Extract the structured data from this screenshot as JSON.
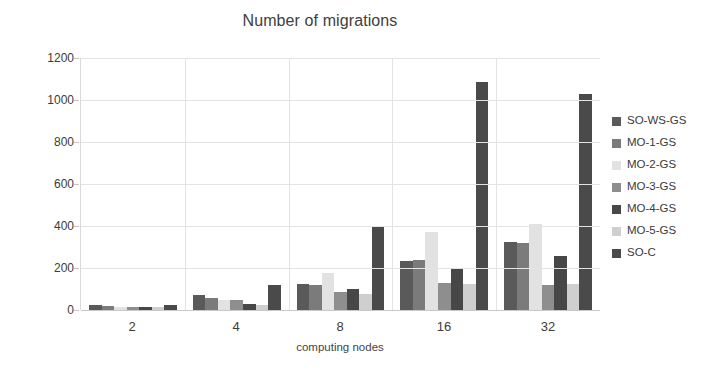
{
  "chart_data": {
    "type": "bar",
    "title": "Number of migrations",
    "xlabel": "computing nodes",
    "ylabel": "",
    "categories": [
      "2",
      "4",
      "8",
      "16",
      "32"
    ],
    "ylim": [
      0,
      1200
    ],
    "yticks": [
      0,
      200,
      400,
      600,
      800,
      1000,
      1200
    ],
    "grid": true,
    "legend_position": "right",
    "series": [
      {
        "name": "SO-WS-GS",
        "color": "#5a5a5a",
        "values": [
          22,
          70,
          125,
          235,
          325
        ]
      },
      {
        "name": "MO-1-GS",
        "color": "#7b7b7b",
        "values": [
          18,
          55,
          120,
          240,
          320
        ]
      },
      {
        "name": "MO-2-GS",
        "color": "#e2e2e2",
        "values": [
          14,
          48,
          175,
          370,
          410
        ]
      },
      {
        "name": "MO-3-GS",
        "color": "#8e8e8e",
        "values": [
          16,
          50,
          85,
          130,
          120
        ]
      },
      {
        "name": "MO-4-GS",
        "color": "#474747",
        "values": [
          14,
          30,
          100,
          200,
          255
        ]
      },
      {
        "name": "MO-5-GS",
        "color": "#cfcfcf",
        "values": [
          12,
          22,
          75,
          125,
          125
        ]
      },
      {
        "name": "SO-C",
        "color": "#4a4a4a",
        "values": [
          25,
          120,
          400,
          1085,
          1030
        ]
      }
    ]
  },
  "axis": {
    "ytick_labels": [
      "1200",
      "1000",
      "800",
      "600",
      "400",
      "200",
      "0"
    ]
  },
  "legend": {
    "items": [
      {
        "label": "SO-WS-GS"
      },
      {
        "label": "MO-1-GS"
      },
      {
        "label": "MO-2-GS"
      },
      {
        "label": "MO-3-GS"
      },
      {
        "label": "MO-4-GS"
      },
      {
        "label": "MO-5-GS"
      },
      {
        "label": "SO-C"
      }
    ]
  }
}
